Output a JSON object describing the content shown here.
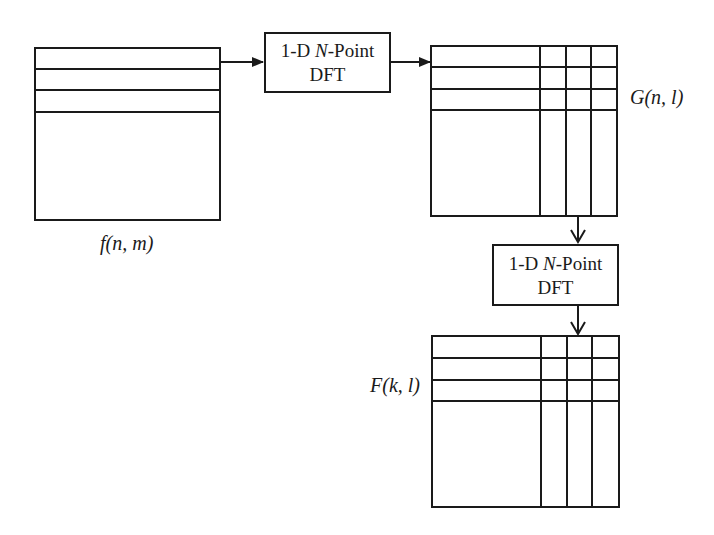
{
  "diagram": {
    "matrices": {
      "input": {
        "label": "f(n, m)"
      },
      "intermediate": {
        "label": "G(n, l)"
      },
      "output": {
        "label": "F(k, l)"
      }
    },
    "blocks": [
      {
        "line1_prefix": "1-D ",
        "line1_var": "N",
        "line1_suffix": "-Point",
        "line2": "DFT"
      },
      {
        "line1_prefix": "1-D ",
        "line1_var": "N",
        "line1_suffix": "-Point",
        "line2": "DFT"
      }
    ],
    "colors": {
      "stroke": "#1a1a1a",
      "background": "#ffffff"
    }
  }
}
